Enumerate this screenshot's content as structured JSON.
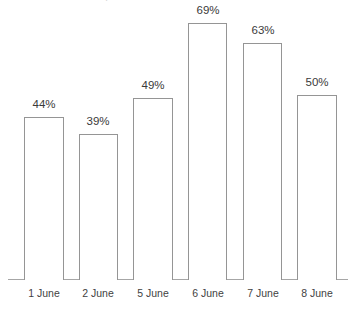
{
  "chart_data": {
    "type": "bar",
    "title": "",
    "xlabel": "",
    "ylabel": "",
    "categories": [
      "1 June",
      "2 June",
      "5 June",
      "6 June",
      "7 June",
      "8 June"
    ],
    "values": [
      44,
      39,
      49,
      69,
      63,
      50
    ],
    "value_labels": [
      "44%",
      "39%",
      "49%",
      "69%",
      "63%",
      "50%"
    ],
    "value_unit": "%",
    "ylim": [
      0,
      75
    ],
    "grid": false,
    "legend": null,
    "legend_position": "none",
    "bar_fill_color": "#ffffff",
    "bar_border_color": "#959595",
    "axis_color": "#a6a6a6",
    "label_color": "#3a3a3a",
    "background_color": "#ffffff",
    "annotations": {
      "cropped_title_remnant": "."
    }
  },
  "geometry": {
    "baseline_y": 279,
    "axis_left": 8,
    "axis_right": 348,
    "px_per_unit": 3.72,
    "bars": [
      {
        "left": 24,
        "width": 40,
        "top": 117,
        "height": 163
      },
      {
        "left": 79,
        "width": 39,
        "top": 134,
        "height": 146
      },
      {
        "left": 133,
        "width": 40,
        "top": 98,
        "height": 182
      },
      {
        "left": 188,
        "width": 39,
        "top": 23,
        "height": 257
      },
      {
        "left": 243,
        "width": 39,
        "top": 43,
        "height": 237
      },
      {
        "left": 297,
        "width": 40,
        "top": 95,
        "height": 185
      }
    ],
    "value_label_offsets": [
      {
        "left": 9,
        "width": 70,
        "top": 98
      },
      {
        "left": 63,
        "width": 70,
        "top": 115
      },
      {
        "left": 118,
        "width": 70,
        "top": 79
      },
      {
        "left": 173,
        "width": 70,
        "top": 4
      },
      {
        "left": 228,
        "width": 70,
        "top": 24
      },
      {
        "left": 282,
        "width": 70,
        "top": 76
      }
    ],
    "category_label_slots": [
      {
        "left": 9,
        "width": 70
      },
      {
        "left": 63,
        "width": 70
      },
      {
        "left": 118,
        "width": 70
      },
      {
        "left": 173,
        "width": 70
      },
      {
        "left": 228,
        "width": 70
      },
      {
        "left": 282,
        "width": 70
      }
    ]
  }
}
